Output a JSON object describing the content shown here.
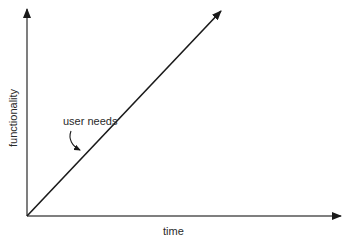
{
  "diagram": {
    "x_axis_label": "time",
    "y_axis_label": "functionality",
    "line_annotation": "user needs",
    "line_color": "#1a1a1a",
    "axis_color": "#3a3a3a"
  }
}
